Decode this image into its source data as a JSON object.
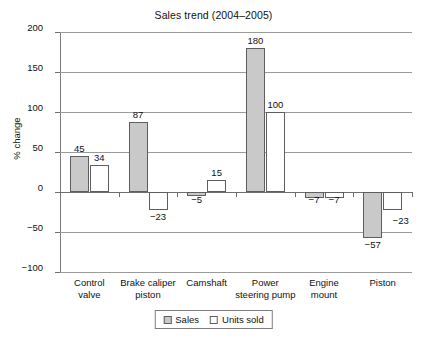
{
  "chart_data": {
    "type": "bar",
    "title": "Sales trend (2004–2005)",
    "xlabel": "",
    "ylabel": "% change",
    "ylim": [
      -100,
      200
    ],
    "yticks": [
      200,
      150,
      100,
      50,
      0,
      -50,
      -100
    ],
    "ytick_labels": [
      "200",
      "150",
      "100",
      "50",
      "0",
      "−50",
      "−100"
    ],
    "grid": true,
    "legend_position": "bottom",
    "categories": [
      "Control valve",
      "Brake caliper piston",
      "Camshaft",
      "Power steering pump",
      "Engine mount",
      "Piston"
    ],
    "category_lines": [
      [
        "Control",
        "valve"
      ],
      [
        "Brake caliper",
        "piston"
      ],
      [
        "Camshaft",
        ""
      ],
      [
        "Power",
        "steering pump"
      ],
      [
        "Engine",
        "mount"
      ],
      [
        "Piston",
        ""
      ]
    ],
    "series": [
      {
        "name": "Sales",
        "color": "#c9c9c9",
        "values": [
          45,
          87,
          -5,
          180,
          -7,
          -57
        ],
        "labels": [
          "45",
          "87",
          "−5",
          "180",
          "−7",
          "−57"
        ]
      },
      {
        "name": "Units sold",
        "color": "#ffffff",
        "values": [
          34,
          -23,
          15,
          100,
          -7,
          -23
        ],
        "labels": [
          "34",
          "−23",
          "15",
          "100",
          "−7",
          "−23"
        ]
      }
    ]
  },
  "legend": {
    "items": [
      {
        "label": "Sales",
        "swatch": "sales"
      },
      {
        "label": "Units sold",
        "swatch": "units"
      }
    ]
  }
}
